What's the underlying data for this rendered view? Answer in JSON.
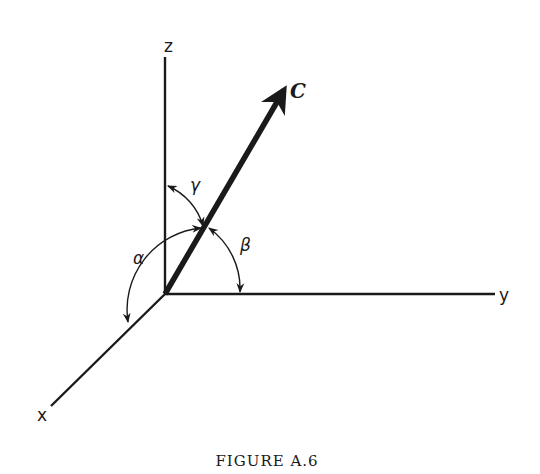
{
  "figure": {
    "caption": "FIGURE A.6",
    "axes": {
      "z": {
        "label": "z"
      },
      "y": {
        "label": "y"
      },
      "x": {
        "label": "x"
      }
    },
    "vector": {
      "label": "C"
    },
    "angles": {
      "alpha": {
        "label": "α",
        "between": "C and x-axis"
      },
      "beta": {
        "label": "β",
        "between": "C and y-axis"
      },
      "gamma": {
        "label": "γ",
        "between": "C and z-axis"
      }
    },
    "colors": {
      "ink": "#1a1a1a",
      "background": "#ffffff"
    }
  }
}
